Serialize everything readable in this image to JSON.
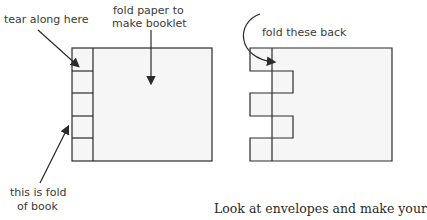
{
  "labels": {
    "tear": "tear along here",
    "fold_paper_1": "fold paper to",
    "fold_paper_2": "make booklet",
    "fold_of_book_1": "this is fold",
    "fold_of_book_2": "of book",
    "fold_back": "fold these back"
  },
  "caption": "Look at envelopes and make your",
  "colors": {
    "line": "#2b2b2b",
    "fill": "#f6f6f6"
  }
}
